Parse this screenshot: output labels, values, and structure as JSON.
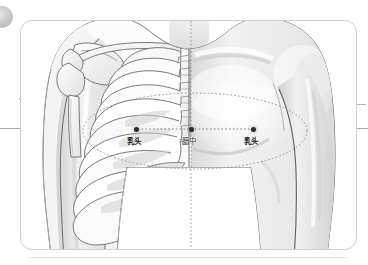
{
  "figure": {
    "view": "anterior",
    "halves": {
      "left_label": "skeletal-cutaway",
      "right_label": "skin-surface"
    }
  },
  "points": [
    {
      "id": "left-nipple",
      "label": "乳头",
      "romanization": "ru tou",
      "meaning": "nipple",
      "x": 115,
      "y": 108,
      "label_x": 106,
      "label_y": 117
    },
    {
      "id": "danzhong",
      "label": "膻中",
      "romanization": "dan zhong",
      "meaning": "Danzhong (CV17)",
      "x": 170,
      "y": 108,
      "label_x": 161,
      "label_y": 117
    },
    {
      "id": "right-nipple",
      "label": "乳头",
      "romanization": "ru tou",
      "meaning": "nipple",
      "x": 232,
      "y": 108,
      "label_x": 223,
      "label_y": 117
    }
  ],
  "annotations": {
    "ellipse": {
      "name": "nipple-level-ellipse",
      "cx": 174,
      "cy": 110,
      "rx": 112,
      "ry": 38,
      "style": "dotted"
    },
    "connector": {
      "name": "nipple-line",
      "x1": 115,
      "x2": 232,
      "y": 108,
      "style": "dotted"
    },
    "midline": {
      "name": "sternal-midline",
      "x": 170,
      "style": "dotted"
    },
    "guide_horizontal": {
      "name": "horizontal-measure-guide",
      "y": 128
    },
    "guide_mark_left": {
      "name": "angle-mark-7"
    },
    "guide_tick_right": {
      "name": "right-edge-tick"
    },
    "baseline": {
      "name": "bottom-rule"
    }
  },
  "colors": {
    "card_border": "#cfcfcf",
    "outline": "#555555",
    "bone_fill": "#fbfbfb",
    "bone_shade": "#d6d6d6",
    "skin_light": "#f3f3f3",
    "skin_shade": "#d8d8d8",
    "dot": "#2b2b2b",
    "dotted": "#8c8c8c",
    "guide": "#a9a9a9",
    "label_text": "#1c1c1c"
  }
}
